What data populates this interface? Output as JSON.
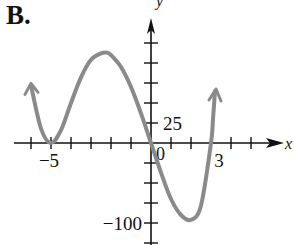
{
  "panel": {
    "label": "B."
  },
  "axes": {
    "x_label": "x",
    "y_label": "y",
    "origin_label": "0",
    "x_tick_labels": [
      {
        "value": -5,
        "text": "−5"
      },
      {
        "value": 3,
        "text": "3"
      }
    ],
    "y_tick_labels": [
      {
        "value": 25,
        "text": "25"
      },
      {
        "value": -100,
        "text": "−100"
      }
    ]
  },
  "colors": {
    "curve": "#8a8a8a",
    "axis": "#111111",
    "background": "#ffffff"
  },
  "chart_data": {
    "type": "line",
    "title": "B.",
    "xlabel": "x",
    "ylabel": "y",
    "xlim": [
      -6,
      6
    ],
    "ylim": [
      -120,
      125
    ],
    "x_tick_step": 1,
    "y_tick_step": 25,
    "labeled_x_ticks": [
      -5,
      3
    ],
    "labeled_y_ticks": [
      25,
      -100
    ],
    "grid": false,
    "legend": null,
    "series": [
      {
        "name": "polynomial curve",
        "points": [
          [
            -6.0,
            72
          ],
          [
            -5.5,
            18
          ],
          [
            -5.0,
            0
          ],
          [
            -4.5,
            16
          ],
          [
            -4.0,
            50
          ],
          [
            -3.5,
            82
          ],
          [
            -3.0,
            104
          ],
          [
            -2.5,
            112
          ],
          [
            -2.2,
            113
          ],
          [
            -2.0,
            110
          ],
          [
            -1.5,
            95
          ],
          [
            -1.0,
            70
          ],
          [
            -0.5,
            37
          ],
          [
            0.0,
            0
          ],
          [
            0.5,
            -37
          ],
          [
            1.0,
            -70
          ],
          [
            1.5,
            -90
          ],
          [
            2.0,
            -96
          ],
          [
            2.5,
            -78
          ],
          [
            3.0,
            0
          ],
          [
            3.1,
            30
          ],
          [
            3.2,
            65
          ]
        ],
        "x_intercepts": [
          -5,
          0,
          3
        ],
        "local_max": [
          -2.2,
          113
        ],
        "local_min": [
          2.0,
          -96
        ],
        "end_behavior": "arrows at both ends pointing upward"
      }
    ]
  }
}
